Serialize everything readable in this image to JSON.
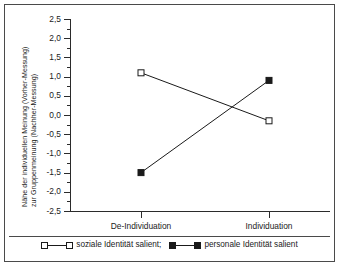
{
  "chart_data": {
    "type": "line",
    "title": "",
    "subtitle": "",
    "xlabel": "",
    "ylabel_line1": "Nähe der individuellen Meinung (Vorher-Messung)",
    "ylabel_line2": "zur Gruppenmeinung (Nachher-Messung)",
    "categories": [
      "De-Individuation",
      "Individuation"
    ],
    "ylim": [
      -2.5,
      2.5
    ],
    "ytick_step": 0.5,
    "yminor_step": 0.25,
    "ytick_labels": [
      "2,5",
      "2,0",
      "1,5",
      "1,0",
      "0,5",
      "0,0",
      "-0,5",
      "-1,0",
      "-1,5",
      "-2,0",
      "-2,5"
    ],
    "ytick_values": [
      2.5,
      2.0,
      1.5,
      1.0,
      0.5,
      0.0,
      -0.5,
      -1.0,
      -1.5,
      -2.0,
      -2.5
    ],
    "grid": false,
    "legend_position": "bottom",
    "series": [
      {
        "name": "soziale Identität salient;",
        "marker": "open-square",
        "color": "#1a1a1a",
        "values": [
          1.1,
          -0.15
        ]
      },
      {
        "name": "personale Identität salient",
        "marker": "filled-square",
        "color": "#1a1a1a",
        "values": [
          -1.5,
          0.9
        ]
      }
    ]
  },
  "legend": {
    "entries": [
      {
        "label": "soziale Identität salient;",
        "marker": "open-square"
      },
      {
        "label": "personale Identität salient",
        "marker": "filled-square"
      }
    ]
  },
  "colors": {
    "axis": "#2b2b2b",
    "frame": "#4a4a4a",
    "text": "#1a1a1a",
    "background": "#ffffff",
    "series_open": "#ffffff",
    "series_filled": "#1a1a1a"
  }
}
